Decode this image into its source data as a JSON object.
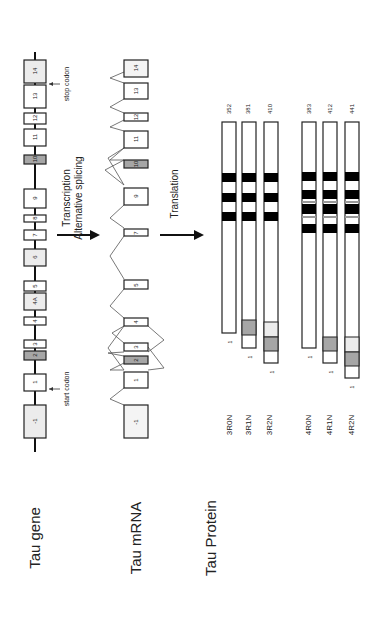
{
  "rows": {
    "gene_label": "Tau gene",
    "mrna_label": "Tau mRNA",
    "protein_label": "Tau Protein"
  },
  "steps": {
    "transcription": "Transcription",
    "splicing": "Alternative splicing",
    "translation": "Translation"
  },
  "annotations": {
    "start_codon": "start codon",
    "stop_codon": "stop codon"
  },
  "colors": {
    "constitutive": "#ffffff",
    "alternative_dark": "#a6a6a6",
    "alternative_light": "#ececec",
    "repeat": "#000000",
    "line": "#222222"
  },
  "gene_exons": [
    {
      "id": "-1",
      "label": "-1",
      "fill": "light"
    },
    {
      "id": "1",
      "label": "1",
      "fill": "white"
    },
    {
      "id": "2",
      "label": "2",
      "fill": "dark"
    },
    {
      "id": "3",
      "label": "3",
      "fill": "white"
    },
    {
      "id": "4",
      "label": "4",
      "fill": "white"
    },
    {
      "id": "4A",
      "label": "4A",
      "fill": "light"
    },
    {
      "id": "5",
      "label": "5",
      "fill": "white"
    },
    {
      "id": "6",
      "label": "6",
      "fill": "light"
    },
    {
      "id": "7",
      "label": "7",
      "fill": "white"
    },
    {
      "id": "8",
      "label": "8",
      "fill": "white"
    },
    {
      "id": "9",
      "label": "9",
      "fill": "white"
    },
    {
      "id": "10",
      "label": "10",
      "fill": "dark"
    },
    {
      "id": "11",
      "label": "11",
      "fill": "white"
    },
    {
      "id": "12",
      "label": "12",
      "fill": "white"
    },
    {
      "id": "13",
      "label": "13",
      "fill": "white"
    },
    {
      "id": "14",
      "label": "14",
      "fill": "light"
    }
  ],
  "mrna_exons": [
    {
      "id": "-1",
      "label": "-1"
    },
    {
      "id": "1",
      "label": "1"
    },
    {
      "id": "2",
      "label": "2"
    },
    {
      "id": "3",
      "label": "3"
    },
    {
      "id": "4",
      "label": "4"
    },
    {
      "id": "5",
      "label": "5"
    },
    {
      "id": "7",
      "label": "7"
    },
    {
      "id": "9",
      "label": "9"
    },
    {
      "id": "10",
      "label": "10"
    },
    {
      "id": "11",
      "label": "11"
    },
    {
      "id": "12",
      "label": "12"
    },
    {
      "id": "13",
      "label": "13"
    },
    {
      "id": "14",
      "label": "14"
    }
  ],
  "isoforms": [
    {
      "name": "3R0N",
      "length": "352",
      "start": "1",
      "repeats": 3,
      "n_inserts": 0
    },
    {
      "name": "3R1N",
      "length": "381",
      "start": "1",
      "repeats": 3,
      "n_inserts": 1
    },
    {
      "name": "3R2N",
      "length": "410",
      "start": "1",
      "repeats": 3,
      "n_inserts": 2
    },
    {
      "name": "4R0N",
      "length": "383",
      "start": "1",
      "repeats": 4,
      "n_inserts": 0
    },
    {
      "name": "4R1N",
      "length": "412",
      "start": "1",
      "repeats": 4,
      "n_inserts": 1
    },
    {
      "name": "4R2N",
      "length": "441",
      "start": "1",
      "repeats": 4,
      "n_inserts": 2
    }
  ]
}
